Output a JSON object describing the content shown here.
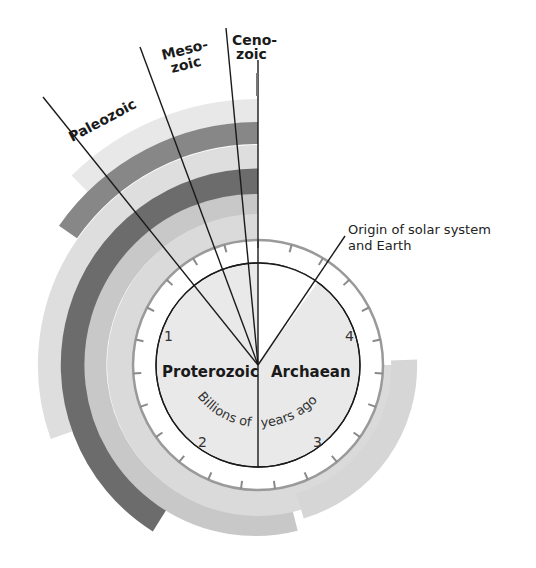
{
  "diagram": {
    "eras": [
      {
        "id": "paleozoic",
        "label": "Paleozoic"
      },
      {
        "id": "mesozoic",
        "label_line1": "Meso-",
        "label_line2": "zoic"
      },
      {
        "id": "cenozoic",
        "label_line1": "Ceno-",
        "label_line2": "zoic"
      }
    ],
    "eons": [
      {
        "id": "proterozoic",
        "label": "Proterozoic"
      },
      {
        "id": "archaean",
        "label": "Archaean"
      }
    ],
    "scale_numbers": [
      "1",
      "2",
      "3",
      "4"
    ],
    "axis_label_part1": "Billions of",
    "axis_label_part2": "years ago",
    "annotation": {
      "line1": "Origin of solar system",
      "line2": "and Earth"
    },
    "colors": {
      "dark_band": "#6e6e6e",
      "medium_dark_band": "#8a8a8a",
      "medium_band": "#c4c4c4",
      "light_band": "#dcdcdc",
      "lightest_band": "#e6e6e6",
      "disc_fill": "#e9e9e9",
      "ring_fill": "#ffffff",
      "ring_edge": "#9a9a9a",
      "line": "#1a1a1a"
    }
  }
}
